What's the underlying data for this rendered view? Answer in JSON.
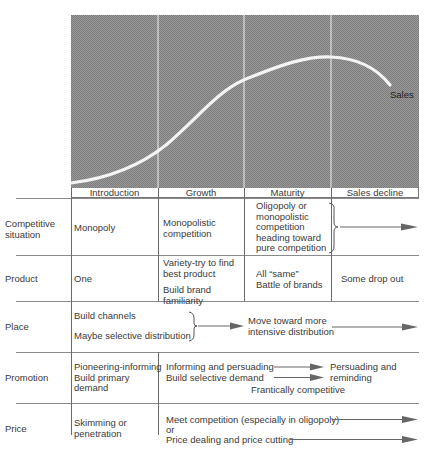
{
  "chart": {
    "curve_label": "Sales",
    "stages": [
      "Introduction",
      "Growth",
      "Maturity",
      "Sales decline"
    ],
    "background_color": "#8c8c8c",
    "curve_color": "#f4f4f4"
  },
  "rows": {
    "competitive": {
      "label_line1": "Competitive",
      "label_line2": "situation",
      "introduction": "Monopoly",
      "growth_line1": "Monopolistic",
      "growth_line2": "competition",
      "maturity_lines": [
        "Oligopoly or",
        "monopolistic",
        "competition",
        "heading toward",
        "pure competition"
      ]
    },
    "product": {
      "label": "Product",
      "introduction": "One",
      "growth_lines": [
        "Variety-try to find",
        "best product"
      ],
      "growth_lines2": [
        "Build brand",
        "familiarity"
      ],
      "maturity_lines": [
        "All “same”",
        "Battle of brands"
      ],
      "decline": "Some drop out"
    },
    "place": {
      "label": "Place",
      "line1": "Build channels",
      "line2": "Maybe selective distribution",
      "target_lines": [
        "Move toward more",
        "intensive distribution"
      ]
    },
    "promotion": {
      "label": "Promotion",
      "introduction_lines": [
        "Pioneering-informing",
        "Build primary",
        "demand"
      ],
      "growth_line1": "Informing and persuading",
      "growth_line2": "Build selective demand",
      "target_lines": [
        "Persuading and",
        "reminding"
      ],
      "note": "Frantically competitive"
    },
    "price": {
      "label": "Price",
      "introduction_lines": [
        "Skimming or",
        "penetration"
      ],
      "line1": "Meet competition (especially in oligopoly)",
      "line2": "or",
      "line3": "Price dealing and price cutting"
    }
  }
}
